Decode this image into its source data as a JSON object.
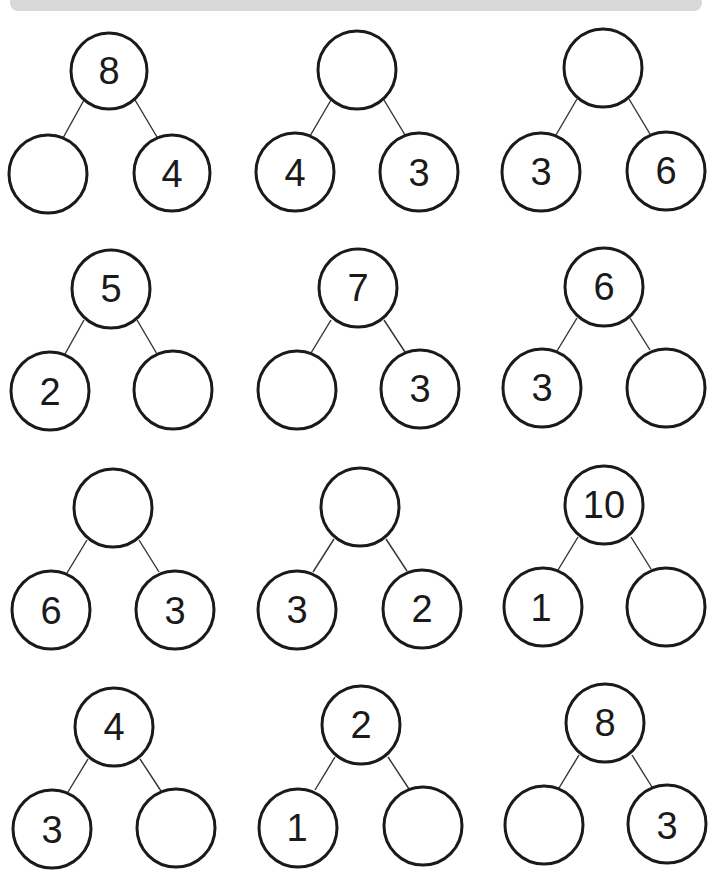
{
  "worksheet": {
    "banner_color": "#d9d9d9",
    "stroke_color": "#1a1a1a",
    "bonds": [
      {
        "whole": "8",
        "left": "",
        "right": "4"
      },
      {
        "whole": "",
        "left": "4",
        "right": "3"
      },
      {
        "whole": "",
        "left": "3",
        "right": "6"
      },
      {
        "whole": "5",
        "left": "2",
        "right": ""
      },
      {
        "whole": "7",
        "left": "",
        "right": "3"
      },
      {
        "whole": "6",
        "left": "3",
        "right": ""
      },
      {
        "whole": "",
        "left": "6",
        "right": "3"
      },
      {
        "whole": "",
        "left": "3",
        "right": "2"
      },
      {
        "whole": "10",
        "left": "1",
        "right": ""
      },
      {
        "whole": "4",
        "left": "3",
        "right": ""
      },
      {
        "whole": "2",
        "left": "1",
        "right": ""
      },
      {
        "whole": "8",
        "left": "",
        "right": "3"
      }
    ]
  }
}
